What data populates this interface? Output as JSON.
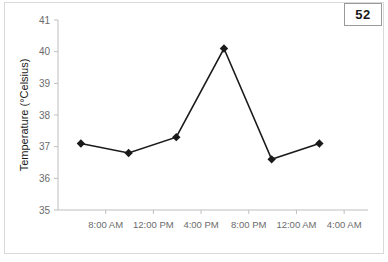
{
  "badge": {
    "label": "52"
  },
  "chart_data": {
    "type": "line",
    "title": "",
    "xlabel": "",
    "ylabel": "Temperature (°Celsius)",
    "ylim": [
      35,
      41
    ],
    "yticks": [
      35,
      36,
      37,
      38,
      39,
      40,
      41
    ],
    "ytick_labels": [
      "35",
      "36",
      "37",
      "38",
      "39",
      "40",
      "41"
    ],
    "xticks": [
      "8:00 AM",
      "12:00 PM",
      "4:00 PM",
      "8:00 PM",
      "12:00 AM",
      "4:00 AM"
    ],
    "xtick_labels": [
      "8:00 AM",
      "12:00 PM",
      "4:00 PM",
      "8:00 PM",
      "12:00 AM",
      "4:00 AM"
    ],
    "x": [
      "6:00 AM",
      "10:00 AM",
      "2:00 PM",
      "6:00 PM",
      "10:00 PM",
      "2:00 AM"
    ],
    "values": [
      37.1,
      36.8,
      37.3,
      40.1,
      36.6,
      37.1
    ],
    "series": [
      {
        "name": "Temperature",
        "values": [
          37.1,
          36.8,
          37.3,
          40.1,
          36.6,
          37.1
        ]
      }
    ],
    "grid": false,
    "legend": false,
    "marker": "diamond",
    "line_color": "#1a1a1a",
    "marker_color": "#1a1a1a",
    "axis_color": "#bfbfbf"
  }
}
